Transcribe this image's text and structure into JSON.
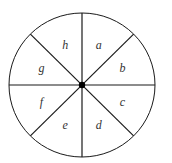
{
  "diagram": {
    "type": "spinner",
    "sector_count": 8,
    "sectors": [
      {
        "label": "a"
      },
      {
        "label": "b"
      },
      {
        "label": "c"
      },
      {
        "label": "d"
      },
      {
        "label": "e"
      },
      {
        "label": "f"
      },
      {
        "label": "g"
      },
      {
        "label": "h"
      }
    ],
    "colors": {
      "stroke": "#1a1a1a",
      "fill": "#ffffff",
      "text": "#333333"
    }
  }
}
